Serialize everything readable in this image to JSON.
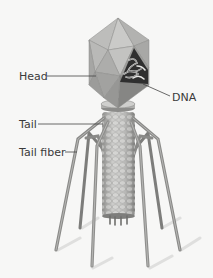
{
  "diagram": {
    "labels": {
      "head": "Head",
      "dna": "DNA",
      "tail": "Tail",
      "tail_fiber": "Tail fiber"
    },
    "colors": {
      "background": "#f7f7f6",
      "head_light": "#c9c9c7",
      "head_mid": "#a9a9a7",
      "head_dark": "#7f7f7d",
      "tail": "#b7b7b5",
      "fiber": "#8e8e8c",
      "dna": "#2a2a2a",
      "label_text": "#3a3a3a",
      "leader_line": "#444444"
    }
  }
}
